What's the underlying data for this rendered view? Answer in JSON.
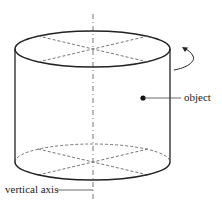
{
  "diagram": {
    "labels": {
      "object": "object",
      "axis": "vertical axis"
    },
    "colors": {
      "stroke": "#222222",
      "dashed": "#666666",
      "background": "#ffffff"
    }
  }
}
